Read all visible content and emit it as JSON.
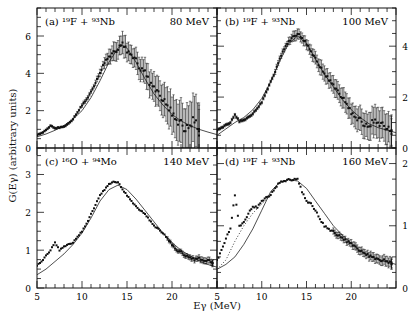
{
  "figure": {
    "y_axis_label": "G(Eγ) (arbitrary units)",
    "x_axis_label": "Eγ (MeV)"
  },
  "chart_data": [
    {
      "type": "scatter",
      "panel": "a",
      "title": "(a) ¹⁹F + ⁹³Nb",
      "energy": "80 MeV",
      "xlabel": "Eγ (MeV)",
      "ylabel": "G(Eγ) (arbitrary units)",
      "xlim": [
        5,
        25
      ],
      "ylim": [
        0,
        7.5
      ],
      "yticks": [
        0,
        2,
        4,
        6
      ],
      "ytick_side": "left",
      "fit_curve": {
        "x": [
          5,
          6,
          7,
          8,
          9,
          10,
          11,
          12,
          13,
          14,
          14.5,
          15,
          16,
          17,
          18,
          19,
          20,
          21,
          22,
          23,
          24,
          25
        ],
        "y": [
          0.6,
          0.75,
          0.95,
          1.2,
          1.55,
          2.0,
          2.7,
          3.6,
          4.6,
          5.35,
          5.5,
          5.35,
          4.6,
          3.7,
          2.9,
          2.3,
          1.8,
          1.45,
          1.2,
          1.0,
          0.85,
          0.72
        ]
      },
      "data": {
        "x": [
          5,
          5.5,
          6,
          6.5,
          7,
          7.5,
          8,
          8.5,
          9,
          9.5,
          10,
          10.5,
          11,
          11.5,
          12,
          12.5,
          13,
          13.5,
          14,
          14.5,
          15,
          15.5,
          16,
          16.5,
          17,
          17.5,
          18,
          18.5,
          19,
          19.5,
          20,
          20.5,
          21,
          21.5,
          22,
          22.5,
          23
        ],
        "y": [
          0.7,
          0.8,
          0.95,
          1.2,
          1.05,
          1.1,
          1.15,
          1.3,
          1.55,
          1.9,
          2.3,
          2.6,
          3.0,
          3.5,
          4.0,
          4.6,
          4.9,
          5.1,
          5.3,
          5.6,
          5.2,
          5.0,
          4.7,
          4.2,
          4.1,
          3.5,
          3.3,
          2.9,
          2.6,
          2.2,
          1.9,
          1.5,
          1.3,
          1.0,
          1.1,
          1.6,
          0.9
        ],
        "err": [
          0.05,
          0.05,
          0.05,
          0.05,
          0.05,
          0.05,
          0.05,
          0.05,
          0.05,
          0.05,
          0.1,
          0.1,
          0.1,
          0.15,
          0.2,
          0.3,
          0.4,
          0.5,
          0.5,
          0.6,
          0.5,
          0.5,
          0.6,
          0.6,
          0.7,
          0.7,
          0.8,
          0.8,
          0.9,
          1.0,
          1.0,
          1.1,
          1.2,
          1.2,
          1.3,
          1.4,
          1.4
        ]
      }
    },
    {
      "type": "scatter",
      "panel": "b",
      "title": "(b) ¹⁹F + ⁹³Nb",
      "energy": "100 MeV",
      "xlabel": "Eγ (MeV)",
      "ylabel": "G(Eγ) (arbitrary units)",
      "xlim": [
        5,
        25
      ],
      "ylim": [
        0,
        5.5
      ],
      "yticks": [
        0,
        2,
        4
      ],
      "ytick_side": "right",
      "fit_curve": {
        "x": [
          5,
          6,
          7,
          8,
          9,
          10,
          11,
          12,
          13,
          14,
          15,
          16,
          17,
          18,
          19,
          20,
          21,
          22,
          23,
          24,
          25
        ],
        "y": [
          0.5,
          0.75,
          1.0,
          1.2,
          1.5,
          1.95,
          2.6,
          3.4,
          4.1,
          4.4,
          4.1,
          3.5,
          2.9,
          2.4,
          1.9,
          1.5,
          1.2,
          0.95,
          0.8,
          0.7,
          0.6
        ]
      },
      "data": {
        "x": [
          5,
          5.5,
          6,
          6.5,
          7,
          7.5,
          8,
          8.5,
          9,
          9.5,
          10,
          10.5,
          11,
          11.5,
          12,
          12.5,
          13,
          13.5,
          14,
          14.5,
          15,
          15.5,
          16,
          16.5,
          17,
          17.5,
          18,
          18.5,
          19,
          19.5,
          20,
          20.5,
          21,
          21.5,
          22,
          22.5,
          23,
          23.5,
          24,
          24.5
        ],
        "y": [
          0.7,
          0.8,
          0.9,
          1.0,
          1.3,
          1.05,
          1.1,
          1.2,
          1.35,
          1.55,
          1.8,
          2.2,
          2.6,
          3.0,
          3.5,
          3.9,
          4.2,
          4.35,
          4.5,
          4.3,
          4.1,
          3.8,
          3.5,
          3.2,
          2.9,
          2.7,
          2.5,
          2.2,
          2.0,
          1.7,
          1.4,
          1.2,
          1.1,
          0.9,
          0.8,
          1.1,
          1.0,
          0.9,
          0.8,
          0.6
        ],
        "err": [
          0.05,
          0.05,
          0.05,
          0.05,
          0.05,
          0.05,
          0.05,
          0.05,
          0.05,
          0.05,
          0.05,
          0.05,
          0.05,
          0.1,
          0.1,
          0.1,
          0.15,
          0.2,
          0.2,
          0.2,
          0.2,
          0.25,
          0.25,
          0.3,
          0.3,
          0.3,
          0.35,
          0.35,
          0.4,
          0.4,
          0.4,
          0.45,
          0.5,
          0.5,
          0.55,
          0.6,
          0.6,
          0.6,
          0.6,
          0.6
        ]
      }
    },
    {
      "type": "scatter",
      "panel": "c",
      "title": "(c) ¹⁶O + ⁹⁴Mo",
      "energy": "140 MeV",
      "xlabel": "Eγ (MeV)",
      "ylabel": "G(Eγ) (arbitrary units)",
      "xlim": [
        5,
        25
      ],
      "ylim": [
        0,
        3.7
      ],
      "yticks": [
        0,
        1,
        2,
        3
      ],
      "ytick_side": "left",
      "xticks": [
        5,
        10,
        15,
        20
      ],
      "fit_curve": {
        "x": [
          5,
          6,
          7,
          8,
          9,
          10,
          11,
          12,
          13,
          14,
          15,
          16,
          17,
          18,
          19,
          20,
          21,
          22,
          23,
          24,
          25
        ],
        "y": [
          0.35,
          0.5,
          0.7,
          0.9,
          1.15,
          1.45,
          1.85,
          2.3,
          2.6,
          2.72,
          2.6,
          2.35,
          2.05,
          1.75,
          1.45,
          1.2,
          1.0,
          0.85,
          0.72,
          0.62,
          0.55
        ]
      },
      "data": {
        "x": [
          5,
          5.5,
          6,
          6.5,
          7,
          7.5,
          8,
          8.5,
          9,
          9.5,
          10,
          10.5,
          11,
          11.5,
          12,
          12.5,
          13,
          13.5,
          14,
          14.5,
          15,
          15.5,
          16,
          16.5,
          17,
          17.5,
          18,
          18.5,
          19,
          19.5,
          20,
          20.5,
          21,
          21.5,
          22,
          22.5,
          23,
          23.5,
          24,
          24.5
        ],
        "y": [
          0.6,
          0.7,
          0.85,
          1.0,
          1.2,
          1.0,
          1.1,
          1.15,
          1.2,
          1.35,
          1.5,
          1.7,
          1.95,
          2.2,
          2.45,
          2.6,
          2.75,
          2.8,
          2.8,
          2.6,
          2.45,
          2.3,
          2.15,
          2.05,
          1.95,
          1.8,
          1.65,
          1.55,
          1.45,
          1.3,
          1.15,
          1.0,
          0.95,
          0.85,
          0.8,
          0.75,
          0.8,
          0.7,
          0.75,
          0.65
        ],
        "err": [
          0.02,
          0.02,
          0.02,
          0.02,
          0.02,
          0.02,
          0.02,
          0.02,
          0.02,
          0.02,
          0.02,
          0.02,
          0.02,
          0.02,
          0.02,
          0.02,
          0.02,
          0.02,
          0.02,
          0.02,
          0.02,
          0.03,
          0.03,
          0.03,
          0.03,
          0.03,
          0.04,
          0.04,
          0.04,
          0.05,
          0.05,
          0.05,
          0.06,
          0.06,
          0.07,
          0.07,
          0.08,
          0.08,
          0.08,
          0.08
        ]
      }
    },
    {
      "type": "scatter",
      "panel": "d",
      "title": "(d) ¹⁹F + ⁹³Nb",
      "energy": "160 MeV",
      "xlabel": "Eγ (MeV)",
      "ylabel": "G(Eγ) (arbitrary units)",
      "xlim": [
        5,
        25
      ],
      "ylim": [
        0,
        2.25
      ],
      "yticks": [
        0,
        1,
        2
      ],
      "ytick_side": "right",
      "xticks": [
        5,
        10,
        15,
        20
      ],
      "fit_curve": {
        "x": [
          5,
          6,
          7,
          8,
          9,
          10,
          11,
          12,
          13,
          14,
          15,
          16,
          17,
          18,
          19,
          20,
          21,
          22,
          23,
          24,
          25
        ],
        "y": [
          0.3,
          0.38,
          0.5,
          0.7,
          0.95,
          1.25,
          1.55,
          1.7,
          1.74,
          1.72,
          1.6,
          1.4,
          1.2,
          1.0,
          0.85,
          0.72,
          0.6,
          0.52,
          0.46,
          0.42,
          0.38
        ]
      },
      "dotted_curve": {
        "x": [
          5,
          6,
          7,
          8,
          9,
          10,
          11
        ],
        "y": [
          0.3,
          0.45,
          0.75,
          1.0,
          1.2,
          1.35,
          1.5
        ]
      },
      "data": {
        "x": [
          4.5,
          5,
          5.5,
          6,
          6.5,
          7,
          7.5,
          8,
          8.5,
          9,
          9.5,
          10,
          10.5,
          11,
          11.5,
          12,
          12.5,
          13,
          13.5,
          14,
          14.5,
          15,
          15.5,
          16,
          16.5,
          17,
          17.5,
          18,
          18.5,
          19,
          19.5,
          20,
          20.5,
          21,
          21.5,
          22,
          22.5,
          23,
          23.5,
          24,
          24.5
        ],
        "y": [
          0.38,
          0.45,
          0.6,
          0.8,
          0.95,
          1.5,
          1.0,
          1.05,
          1.2,
          1.3,
          1.3,
          1.4,
          1.45,
          1.5,
          1.6,
          1.7,
          1.72,
          1.74,
          1.74,
          1.75,
          1.55,
          1.4,
          1.35,
          1.25,
          1.1,
          1.0,
          0.95,
          0.9,
          0.85,
          0.8,
          0.75,
          0.72,
          0.65,
          0.6,
          0.55,
          0.52,
          0.5,
          0.45,
          0.45,
          0.42,
          0.4
        ],
        "err": [
          0.05,
          0.03,
          0.02,
          0.02,
          0.02,
          0.02,
          0.02,
          0.02,
          0.02,
          0.02,
          0.02,
          0.02,
          0.02,
          0.02,
          0.02,
          0.02,
          0.02,
          0.02,
          0.02,
          0.02,
          0.02,
          0.02,
          0.03,
          0.03,
          0.03,
          0.04,
          0.04,
          0.05,
          0.05,
          0.05,
          0.05,
          0.06,
          0.06,
          0.06,
          0.06,
          0.07,
          0.07,
          0.07,
          0.08,
          0.08,
          0.08
        ]
      }
    }
  ]
}
